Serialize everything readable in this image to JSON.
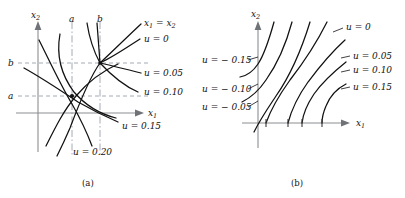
{
  "figure": {
    "panels": [
      {
        "id": "a",
        "caption": "(a)",
        "axes": {
          "x": "x",
          "x_sub": "1",
          "y": "x",
          "y_sub": "2"
        },
        "tick_labels": {
          "y_lower": "a",
          "y_upper": "b",
          "x_left": "a",
          "x_right": "b"
        },
        "diagonal_label": {
          "lhs": "x",
          "lhs_sub": "1",
          "eq": "=",
          "rhs": "x",
          "rhs_sub": "2",
          "text": "x₁ = x₂"
        },
        "contour_labels": [
          {
            "text": "u = 0",
            "value": 0
          },
          {
            "text": "u = 0.05",
            "value": 0.05
          },
          {
            "text": "u = 0.10",
            "value": 0.1
          },
          {
            "text": "u = 0.15",
            "value": 0.15
          },
          {
            "text": "u = 0.20",
            "value": 0.2
          }
        ]
      },
      {
        "id": "b",
        "caption": "(b)",
        "axes": {
          "x": "x",
          "x_sub": "1",
          "y": "x",
          "y_sub": "2"
        },
        "contour_labels_left": [
          {
            "text": "u = − 0.15",
            "value": -0.15
          },
          {
            "text": "u = − 0.10",
            "value": -0.1
          },
          {
            "text": "u = − 0.05",
            "value": -0.05
          }
        ],
        "contour_labels_right": [
          {
            "text": "u = 0",
            "value": 0
          },
          {
            "text": "u = 0.05",
            "value": 0.05
          },
          {
            "text": "u = 0.10",
            "value": 0.1
          },
          {
            "text": "u = 0.15",
            "value": 0.15
          }
        ]
      }
    ]
  },
  "chart_data": {
    "type": "line",
    "title": "",
    "xlabel": "x1",
    "ylabel": "x2",
    "grid": false,
    "legend": "inline-labels",
    "panels": [
      {
        "id": "a",
        "caption": "(a)",
        "xlabel": "x1",
        "ylabel": "x2",
        "reference_line": "x1 = x2",
        "reference_markers": {
          "vertical_dashdot": [
            "a",
            "b"
          ],
          "horizontal_dashed": [
            "a",
            "b"
          ]
        },
        "fan_vertex": {
          "x": "b",
          "y": "b"
        },
        "crossing_point": {
          "x": "a",
          "y": "a"
        },
        "series": [
          {
            "name": "x1 = x2",
            "type": "diagonal-through-fan-vertex"
          },
          {
            "name": "u = 0",
            "value": 0
          },
          {
            "name": "u = 0.05",
            "value": 0.05
          },
          {
            "name": "u = 0.10",
            "value": 0.1
          },
          {
            "name": "u = 0.15",
            "value": 0.15
          },
          {
            "name": "u = 0.20",
            "value": 0.2
          }
        ]
      },
      {
        "id": "b",
        "caption": "(b)",
        "xlabel": "x1",
        "ylabel": "x2",
        "series": [
          {
            "name": "u = -0.15",
            "value": -0.15
          },
          {
            "name": "u = -0.10",
            "value": -0.1
          },
          {
            "name": "u = -0.05",
            "value": -0.05
          },
          {
            "name": "u = 0",
            "value": 0
          },
          {
            "name": "u = 0.05",
            "value": 0.05
          },
          {
            "name": "u = 0.10",
            "value": 0.1
          },
          {
            "name": "u = 0.15",
            "value": 0.15
          }
        ]
      }
    ]
  }
}
